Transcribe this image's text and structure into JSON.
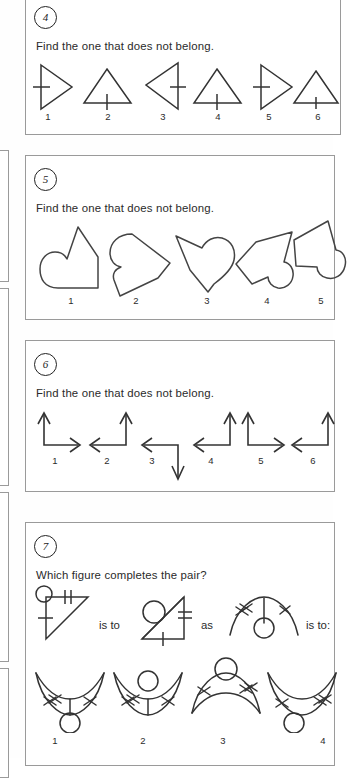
{
  "page": {
    "background_color": "#fefefe",
    "panel_border_color": "#9a9a9a",
    "ink_color": "#2b2b2b"
  },
  "questions": [
    {
      "number": "4",
      "prompt": "Find the one that does not belong.",
      "kind": "odd-one-out",
      "option_labels": [
        "1",
        "2",
        "3",
        "4",
        "5",
        "6"
      ],
      "figure_descriptions": [
        "right-pointing triangle with vertical left side and horizontal tick crossing it",
        "upward triangle with horizontal base and vertical tick crossing base",
        "left-pointing triangle with vertical right side and horizontal tick crossing it",
        "upward triangle with horizontal base and vertical tick crossing base",
        "right-pointing triangle with vertical left side and horizontal tick crossing it",
        "upward triangle with horizontal base and short vertical tick crossing base"
      ]
    },
    {
      "number": "5",
      "prompt": "Find the one that does not belong.",
      "kind": "odd-one-out",
      "option_labels": [
        "1",
        "2",
        "3",
        "4",
        "5"
      ],
      "figure_descriptions": [
        "blob with rounded lobe on lower-left and angular peak upper-right",
        "blob with rounded lobe on upper-left and angular point to the right",
        "heart-like blob with rounded lobe on upper-right and point at bottom",
        "blob with angular point upper-right and rounded lobe lower-right",
        "blob with angular peak at top and rounded lobe on right side"
      ]
    },
    {
      "number": "6",
      "prompt": "Find the one that does not belong.",
      "kind": "odd-one-out",
      "option_labels": [
        "1",
        "2",
        "3",
        "4",
        "5",
        "6"
      ],
      "figure_descriptions": [
        "L-shaped double arrow: up and right",
        "L-shaped double arrow: up and left",
        "L-shaped double arrow: left and down",
        "L-shaped double arrow: up and left",
        "L-shaped double arrow: up and right",
        "L-shaped double arrow: up and left"
      ]
    },
    {
      "number": "7",
      "prompt": "Which figure completes the pair?",
      "kind": "analogy",
      "connector_a": "is to",
      "connector_b": "as",
      "connector_c": "is to:",
      "analogy_terms": [
        "right triangle with circle at top-left vertex, double tick on top edge, single tick on left edge",
        "rotated triangle with circle on upper-left, double tick on right edge, tick on bottom edge",
        "arc (dome) with circle below centre, vertical stem, double tick left of arc and single tick right of arc"
      ],
      "option_labels": [
        "1",
        "2",
        "3",
        "4"
      ],
      "figure_descriptions": [
        "upward-opening crescent with stem and circle below, double tick left and single tick right",
        "upward-opening crescent with circle on top of stem, double tick left and single tick right",
        "downward-opening dome with circle above, single tick left and double tick right",
        "upward-opening crescent with circle below at left, single tick left and double tick right"
      ]
    }
  ]
}
